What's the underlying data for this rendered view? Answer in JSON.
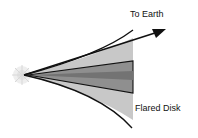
{
  "diagram": {
    "labels": {
      "earth": "To Earth",
      "disk": "Flared Disk"
    },
    "elements": {
      "star": "star-icon",
      "arrow": "arrow-to-earth",
      "outer_disk": "flared-outer-disk",
      "inner_disk": "dense-inner-midplane"
    },
    "colors": {
      "outer_fill": "#c8c8c8",
      "inner_fill": "#8a8a8a",
      "midplane": "#6e6e6e",
      "stroke": "#111111",
      "star_glow": "#e6e6e6"
    }
  }
}
